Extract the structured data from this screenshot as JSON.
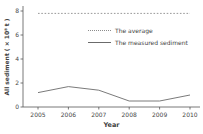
{
  "chart_data": {
    "type": "line",
    "title": "",
    "xlabel": "Year",
    "ylabel": "All sediment ( × 10⁸ t )",
    "categories": [
      "2005",
      "2006",
      "2007",
      "2008",
      "2009",
      "2010"
    ],
    "y_ticks": [
      "0",
      "2",
      "4",
      "6",
      "8"
    ],
    "ylim": [
      0,
      8
    ],
    "grid": false,
    "legend_position": "upper-center inside",
    "series": [
      {
        "name": "The average",
        "style": "dotted",
        "color": "#8c8c8c",
        "values": [
          7.8,
          7.8,
          7.8,
          7.8,
          7.8,
          7.8
        ]
      },
      {
        "name": "The measured sediment",
        "style": "solid",
        "color": "#6b6b6b",
        "values": [
          1.2,
          1.7,
          1.4,
          0.5,
          0.5,
          1.0
        ]
      }
    ]
  },
  "colors": {
    "background": "#ffffff",
    "axis": "#555555",
    "tick_text": "#474747",
    "label_text": "#3f3f3f"
  }
}
